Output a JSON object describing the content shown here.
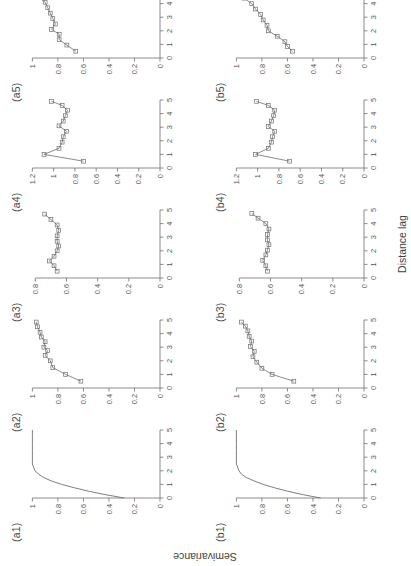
{
  "figure": {
    "x_axis_title": "Distance lag",
    "y_axis_title": "Semivariance",
    "rows": [
      "a",
      "b"
    ],
    "columns": 5
  },
  "chart_data": [
    {
      "type": "line",
      "title": "(a1)",
      "xlabel": "Distance lag",
      "ylabel": "Semivariance",
      "xlim": [
        0,
        5
      ],
      "ylim": [
        0,
        1.05
      ],
      "xticks": [
        0,
        1,
        2,
        3,
        4,
        5
      ],
      "xticklabels": [
        "0",
        "1",
        "2",
        "3",
        "4",
        "5"
      ],
      "yticks": [
        0,
        0.2,
        0.4,
        0.6,
        0.8,
        1
      ],
      "yticklabels": [
        "0",
        "0.2",
        "0.4",
        "0.6",
        "0.8",
        "1"
      ],
      "grid": false,
      "markers": false,
      "x": [
        0,
        0.25,
        0.5,
        0.75,
        1.0,
        1.25,
        1.5,
        1.75,
        2.0,
        2.5,
        3.0,
        3.5,
        4.0,
        4.5,
        5.0
      ],
      "values": [
        0.28,
        0.43,
        0.56,
        0.67,
        0.77,
        0.85,
        0.91,
        0.95,
        0.98,
        1.0,
        1.0,
        1.0,
        1.0,
        1.0,
        1.0
      ]
    },
    {
      "type": "line",
      "title": "(a2)",
      "xlim": [
        0,
        5
      ],
      "ylim": [
        0,
        1.05
      ],
      "xticks": [
        0,
        1,
        2,
        3,
        4,
        5
      ],
      "xticklabels": [
        "0",
        "1",
        "2",
        "3",
        "4",
        "5"
      ],
      "yticks": [
        0,
        0.2,
        0.4,
        0.6,
        0.8,
        1
      ],
      "yticklabels": [
        "0",
        "0.2",
        "0.4",
        "0.6",
        "0.8",
        "1"
      ],
      "grid": false,
      "markers": true,
      "x": [
        0.5,
        1.0,
        1.5,
        2.0,
        2.4,
        2.75,
        3.0,
        3.4,
        3.75,
        4.1,
        4.5,
        4.85
      ],
      "values": [
        0.62,
        0.74,
        0.84,
        0.86,
        0.9,
        0.88,
        0.91,
        0.9,
        0.93,
        0.94,
        0.96,
        0.97
      ]
    },
    {
      "type": "line",
      "title": "(a3)",
      "xlim": [
        0,
        5
      ],
      "ylim": [
        0,
        0.86
      ],
      "xticks": [
        0,
        1,
        2,
        3,
        4,
        5
      ],
      "xticklabels": [
        "0",
        "1",
        "2",
        "3",
        "4",
        "5"
      ],
      "yticks": [
        0,
        0.2,
        0.4,
        0.6,
        0.8
      ],
      "yticklabels": [
        "0",
        "0.2",
        "0.4",
        "0.6",
        "0.8"
      ],
      "grid": false,
      "markers": true,
      "x": [
        0.5,
        0.9,
        1.25,
        1.6,
        2.0,
        2.35,
        2.7,
        3.1,
        3.5,
        3.9,
        4.3,
        4.7
      ],
      "values": [
        0.66,
        0.68,
        0.71,
        0.68,
        0.66,
        0.65,
        0.66,
        0.66,
        0.65,
        0.66,
        0.7,
        0.74
      ]
    },
    {
      "type": "line",
      "title": "(a4)",
      "xlim": [
        0,
        5
      ],
      "ylim": [
        0,
        1.26
      ],
      "xticks": [
        0,
        1,
        2,
        3,
        4,
        5
      ],
      "xticklabels": [
        "0",
        "1",
        "2",
        "3",
        "4",
        "5"
      ],
      "yticks": [
        0,
        0.2,
        0.4,
        0.6,
        0.8,
        1,
        1.2
      ],
      "yticklabels": [
        "0",
        "0.2",
        "0.4",
        "0.6",
        "0.8",
        "1",
        "1.2"
      ],
      "grid": false,
      "markers": true,
      "x": [
        0.5,
        1.0,
        1.45,
        1.9,
        2.3,
        2.7,
        3.1,
        3.45,
        3.85,
        4.25,
        4.6,
        4.9
      ],
      "values": [
        0.72,
        1.09,
        0.95,
        0.92,
        0.91,
        0.88,
        0.95,
        0.91,
        0.89,
        0.87,
        0.92,
        1.02
      ]
    },
    {
      "type": "line",
      "title": "(a5)",
      "xlim": [
        0,
        5
      ],
      "ylim": [
        0,
        1.05
      ],
      "xticks": [
        0,
        1,
        2,
        3,
        4,
        5
      ],
      "xticklabels": [
        "0",
        "1",
        "2",
        "3",
        "4",
        "5"
      ],
      "yticks": [
        0,
        0.2,
        0.4,
        0.6,
        0.8,
        1
      ],
      "yticklabels": [
        "0",
        "0.2",
        "0.4",
        "0.6",
        "0.8",
        "1"
      ],
      "grid": false,
      "markers": true,
      "x": [
        0.5,
        0.95,
        1.35,
        1.75,
        2.1,
        2.5,
        2.9,
        3.3,
        3.7,
        4.1,
        4.45,
        4.8
      ],
      "values": [
        0.66,
        0.73,
        0.79,
        0.79,
        0.85,
        0.82,
        0.84,
        0.86,
        0.88,
        0.9,
        0.95,
        0.99
      ]
    },
    {
      "type": "line",
      "title": "(b1)",
      "xlim": [
        0,
        5
      ],
      "ylim": [
        0,
        1.05
      ],
      "xticks": [
        0,
        1,
        2,
        3,
        4,
        5
      ],
      "xticklabels": [
        "0",
        "1",
        "2",
        "3",
        "4",
        "5"
      ],
      "yticks": [
        0,
        0.2,
        0.4,
        0.6,
        0.8,
        1
      ],
      "yticklabels": [
        "0",
        "0.2",
        "0.4",
        "0.6",
        "0.8",
        "1"
      ],
      "grid": false,
      "markers": false,
      "x": [
        0,
        0.25,
        0.5,
        0.75,
        1.0,
        1.25,
        1.5,
        1.75,
        2.0,
        2.5,
        3.0,
        3.5,
        4.0,
        4.5,
        5.0
      ],
      "values": [
        0.34,
        0.48,
        0.6,
        0.7,
        0.79,
        0.86,
        0.92,
        0.96,
        0.98,
        1.0,
        1.0,
        1.0,
        1.0,
        1.0,
        1.0
      ]
    },
    {
      "type": "line",
      "title": "(b2)",
      "xlim": [
        0,
        5
      ],
      "ylim": [
        0,
        1.05
      ],
      "xticks": [
        0,
        1,
        2,
        3,
        4,
        5
      ],
      "xticklabels": [
        "0",
        "1",
        "2",
        "3",
        "4",
        "5"
      ],
      "yticks": [
        0,
        0.2,
        0.4,
        0.6,
        0.8,
        1
      ],
      "yticklabels": [
        "0",
        "0.2",
        "0.4",
        "0.6",
        "0.8",
        "1"
      ],
      "grid": false,
      "markers": true,
      "x": [
        0.5,
        1.0,
        1.45,
        1.9,
        2.3,
        2.7,
        3.05,
        3.45,
        3.8,
        4.2,
        4.55,
        4.85
      ],
      "values": [
        0.55,
        0.72,
        0.8,
        0.84,
        0.87,
        0.86,
        0.89,
        0.88,
        0.9,
        0.91,
        0.93,
        0.96
      ]
    },
    {
      "type": "line",
      "title": "(b3)",
      "xlim": [
        0,
        5
      ],
      "ylim": [
        0,
        0.86
      ],
      "xticks": [
        0,
        1,
        2,
        3,
        4,
        5
      ],
      "xticklabels": [
        "0",
        "1",
        "2",
        "3",
        "4",
        "5"
      ],
      "yticks": [
        0,
        0.2,
        0.4,
        0.6,
        0.8
      ],
      "yticklabels": [
        "0",
        "0.2",
        "0.4",
        "0.6",
        "0.8"
      ],
      "grid": false,
      "markers": true,
      "x": [
        0.5,
        0.9,
        1.3,
        1.7,
        2.05,
        2.45,
        2.8,
        3.2,
        3.6,
        4.0,
        4.4,
        4.75
      ],
      "values": [
        0.62,
        0.63,
        0.65,
        0.63,
        0.62,
        0.61,
        0.62,
        0.62,
        0.61,
        0.63,
        0.68,
        0.72
      ]
    },
    {
      "type": "line",
      "title": "(b4)",
      "xlim": [
        0,
        5
      ],
      "ylim": [
        0,
        1.26
      ],
      "xticks": [
        0,
        1,
        2,
        3,
        4,
        5
      ],
      "xticklabels": [
        "0",
        "1",
        "2",
        "3",
        "4",
        "5"
      ],
      "yticks": [
        0,
        0.2,
        0.4,
        0.6,
        0.8,
        1,
        1.2
      ],
      "yticklabels": [
        "0",
        "0.2",
        "0.4",
        "0.6",
        "0.8",
        "1",
        "1.2"
      ],
      "grid": false,
      "markers": true,
      "x": [
        0.5,
        1.0,
        1.45,
        1.9,
        2.3,
        2.7,
        3.05,
        3.45,
        3.85,
        4.25,
        4.6,
        4.9
      ],
      "values": [
        0.7,
        1.02,
        0.9,
        0.87,
        0.86,
        0.84,
        0.9,
        0.87,
        0.85,
        0.84,
        0.9,
        1.01
      ]
    },
    {
      "type": "line",
      "title": "(b5)",
      "xlim": [
        0,
        5
      ],
      "ylim": [
        0,
        1.05
      ],
      "xticks": [
        0,
        1,
        2,
        3,
        4,
        5
      ],
      "xticklabels": [
        "0",
        "1",
        "2",
        "3",
        "4",
        "5"
      ],
      "yticks": [
        0,
        0.2,
        0.4,
        0.6,
        0.8,
        1
      ],
      "yticklabels": [
        "0",
        "0.2",
        "0.4",
        "0.6",
        "0.8",
        "1"
      ],
      "grid": false,
      "markers": true,
      "x": [
        0.5,
        0.85,
        1.2,
        1.6,
        2.0,
        2.4,
        2.8,
        3.2,
        3.6,
        4.0,
        4.4,
        4.8
      ],
      "values": [
        0.56,
        0.6,
        0.62,
        0.68,
        0.75,
        0.76,
        0.79,
        0.81,
        0.85,
        0.88,
        0.94,
        1.0
      ]
    }
  ]
}
